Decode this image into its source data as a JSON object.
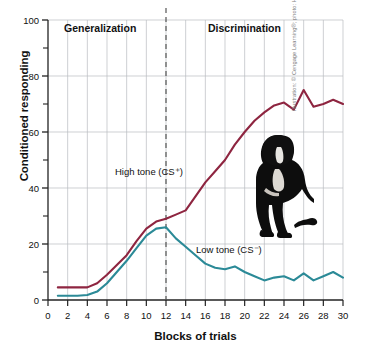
{
  "figure": {
    "credit": "Illustration: © Cengage Learning®; photo: HelleM/Shutterstock.com",
    "dog_photo_alt": "black-dog-sitting-photo"
  },
  "chart_data": {
    "type": "line",
    "title": "",
    "xlabel": "Blocks of trials",
    "ylabel": "Conditioned responding",
    "xlim": [
      0,
      30
    ],
    "ylim": [
      0,
      100
    ],
    "xticks": [
      0,
      2,
      4,
      6,
      8,
      10,
      12,
      14,
      16,
      18,
      20,
      22,
      24,
      26,
      28,
      30
    ],
    "yticks": [
      0,
      20,
      40,
      60,
      80,
      100
    ],
    "yminorticks": [
      10,
      30,
      50,
      70,
      90
    ],
    "grid": true,
    "legend_position": "inline-annotations",
    "annotations": [
      {
        "text": "Generalization",
        "x": 6,
        "y": 95
      },
      {
        "text": "Discrimination",
        "x": 21,
        "y": 95
      },
      {
        "text": "High tone (CS⁺)",
        "x": 9,
        "y": 44
      },
      {
        "text": "Low tone (CS⁻)",
        "x": 19,
        "y": 16
      }
    ],
    "vline": {
      "x": 12,
      "style": "dashed",
      "color": "#555555"
    },
    "x": [
      1,
      2,
      3,
      4,
      5,
      6,
      7,
      8,
      9,
      10,
      11,
      12,
      13,
      14,
      15,
      16,
      17,
      18,
      19,
      20,
      21,
      22,
      23,
      24,
      25,
      26,
      27,
      28,
      29,
      30
    ],
    "series": [
      {
        "name": "High tone (CS⁺)",
        "color": "#8e2540",
        "values": [
          4.5,
          4.5,
          4.5,
          4.5,
          6,
          9,
          12.5,
          16,
          21,
          25.5,
          28,
          29,
          30.5,
          32,
          37,
          42,
          46,
          50,
          55.5,
          60,
          64,
          67,
          69.5,
          70.5,
          68,
          75,
          69,
          70,
          71.5,
          70
        ]
      },
      {
        "name": "Low tone (CS⁻)",
        "color": "#2b8a97",
        "values": [
          1.5,
          1.5,
          1.5,
          1.8,
          3,
          6,
          10,
          14,
          18.5,
          23,
          25.5,
          26,
          22,
          19,
          16,
          13,
          11.5,
          11,
          12,
          10,
          8.5,
          7,
          8,
          8.5,
          7,
          9.5,
          7,
          8.5,
          10,
          8
        ]
      }
    ]
  }
}
